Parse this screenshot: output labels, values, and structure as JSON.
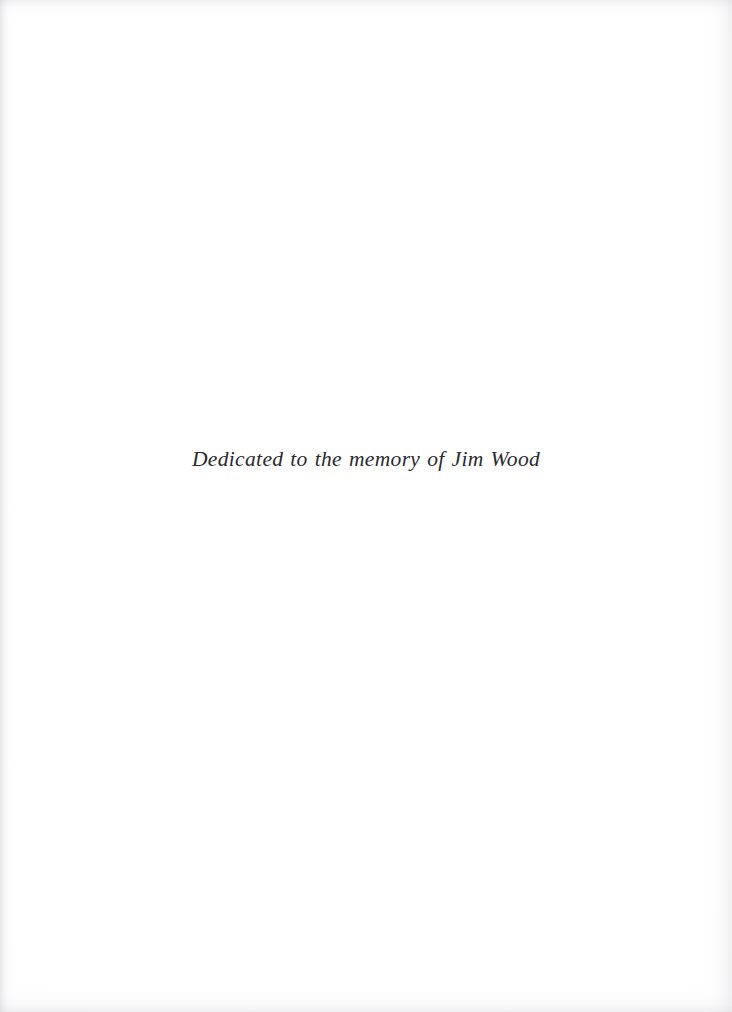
{
  "page": {
    "kind": "book-dedication-page",
    "background_color": "#ffffff",
    "width": 732,
    "height": 1012
  },
  "dedication": {
    "text": "Dedicated to the memory of Jim Wood",
    "text_color": "#2a2a2e",
    "alignment": "center"
  },
  "scan_artifacts": {
    "left_edge_shadow": "#afafb6",
    "right_edge_shadow": "#c4c4cb",
    "top_edge_shadow": "#c6c6cd",
    "bottom_edge_shadow": "#cdcdd4"
  }
}
